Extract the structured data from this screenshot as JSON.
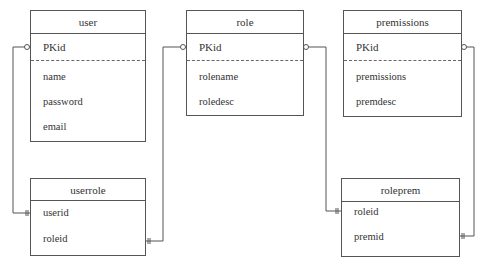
{
  "entities": {
    "user": {
      "title": "user",
      "pk": "PKid",
      "fields": [
        "name",
        "password",
        "email"
      ]
    },
    "role": {
      "title": "role",
      "pk": "PKid",
      "fields": [
        "rolename",
        "roledesc"
      ]
    },
    "premissions": {
      "title": "premissions",
      "pk": "PKid",
      "fields": [
        "premissions",
        "premdesc"
      ]
    },
    "userrole": {
      "title": "userrole",
      "fields": [
        "userid",
        "roleid"
      ]
    },
    "roleprem": {
      "title": "roleprem",
      "fields": [
        "roleid",
        "premid"
      ]
    }
  },
  "relationships": [
    {
      "from": "user.PKid",
      "to": "userrole.userid",
      "from_cardinality": "zero-or-many",
      "to_cardinality": "one-and-only-one"
    },
    {
      "from": "role.PKid",
      "to": "userrole.roleid",
      "from_cardinality": "zero-or-many",
      "to_cardinality": "one-and-only-one"
    },
    {
      "from": "role.PKid",
      "to": "roleprem.roleid",
      "from_cardinality": "zero-or-many",
      "to_cardinality": "one-and-only-one"
    },
    {
      "from": "premissions.PKid",
      "to": "roleprem.premid",
      "from_cardinality": "zero-or-many",
      "to_cardinality": "one-and-only-one"
    }
  ]
}
